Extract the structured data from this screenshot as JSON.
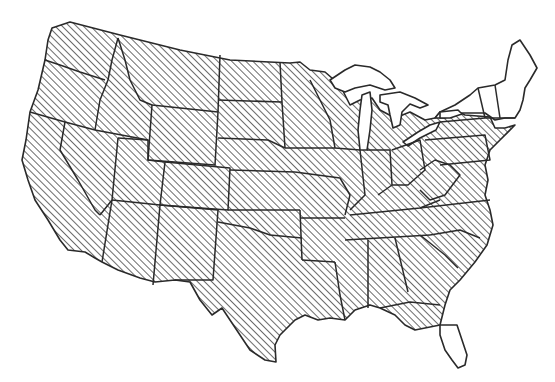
{
  "map": {
    "region": "Contiguous United States",
    "style": "black-and-white line map with diagonal hatching",
    "colors": {
      "background": "#ffffff",
      "outline": "#2a2a2a",
      "hatch": "#3a3a3a"
    },
    "legend": null,
    "hatched_region_note": "Most of contiguous US is hatched",
    "unhatched_areas": [
      "Northern New York",
      "Vermont",
      "New Hampshire",
      "Maine",
      "Southern Florida",
      "Great Lakes (water)"
    ]
  }
}
